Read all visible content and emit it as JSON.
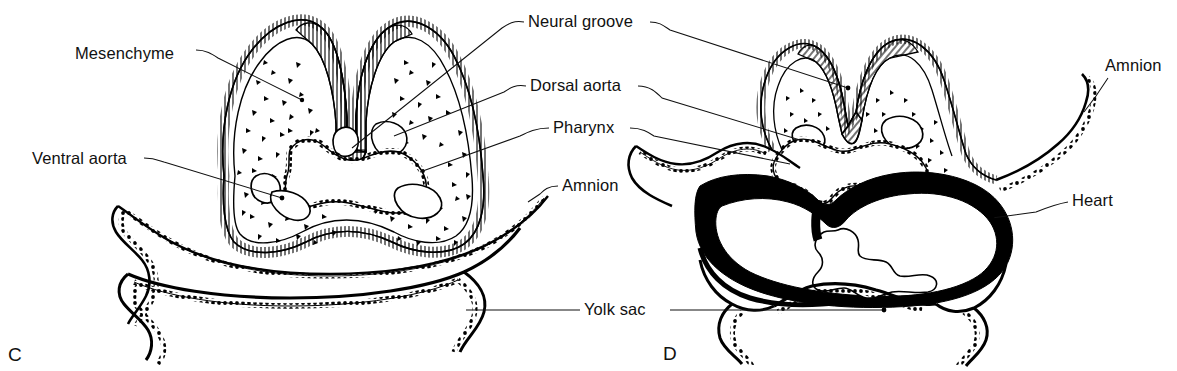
{
  "figure": {
    "type": "anatomical-line-diagram",
    "background_color": "#ffffff",
    "ink_color": "#000000"
  },
  "panels": [
    {
      "id": "C",
      "letter": "C",
      "x": 8,
      "y": 345
    },
    {
      "id": "D",
      "letter": "D",
      "x": 663,
      "y": 344
    }
  ],
  "labels": [
    {
      "id": "mesenchyme",
      "text": "Mesenchyme",
      "x": 75,
      "y": 45,
      "align": "left",
      "panel": "C"
    },
    {
      "id": "ventral-aorta",
      "text": "Ventral aorta",
      "x": 32,
      "y": 150,
      "align": "left",
      "panel": "C"
    },
    {
      "id": "neural-groove",
      "text": "Neural groove",
      "x": 528,
      "y": 13,
      "align": "left",
      "panel": "both"
    },
    {
      "id": "dorsal-aorta",
      "text": "Dorsal aorta",
      "x": 530,
      "y": 77,
      "align": "left",
      "panel": "both"
    },
    {
      "id": "pharynx",
      "text": "Pharynx",
      "x": 553,
      "y": 119,
      "align": "left",
      "panel": "both"
    },
    {
      "id": "amnion-left",
      "text": "Amnion",
      "x": 562,
      "y": 177,
      "align": "left",
      "panel": "C"
    },
    {
      "id": "yolk-sac",
      "text": "Yolk sac",
      "x": 584,
      "y": 301,
      "align": "left",
      "panel": "both"
    },
    {
      "id": "amnion-right",
      "text": "Amnion",
      "x": 1105,
      "y": 57,
      "align": "left",
      "panel": "D"
    },
    {
      "id": "heart",
      "text": "Heart",
      "x": 1072,
      "y": 192,
      "align": "left",
      "panel": "D"
    }
  ],
  "structures": {
    "panel_c": [
      "surface-ectoderm-hatched",
      "neural-groove-folds",
      "mesenchyme-stippled",
      "dorsal-aortae-pair",
      "ventral-aortae-pair",
      "pericardial-cavity",
      "amnion-membrane",
      "yolk-sac-membrane"
    ],
    "panel_d": [
      "surface-ectoderm-hatched",
      "neural-groove-folds",
      "mesenchyme-stippled",
      "dorsal-aortae-pair",
      "pharynx-cavity",
      "heart-myocardium-solid",
      "endocardial-tube",
      "amnion-membrane",
      "yolk-sac-membrane"
    ]
  }
}
